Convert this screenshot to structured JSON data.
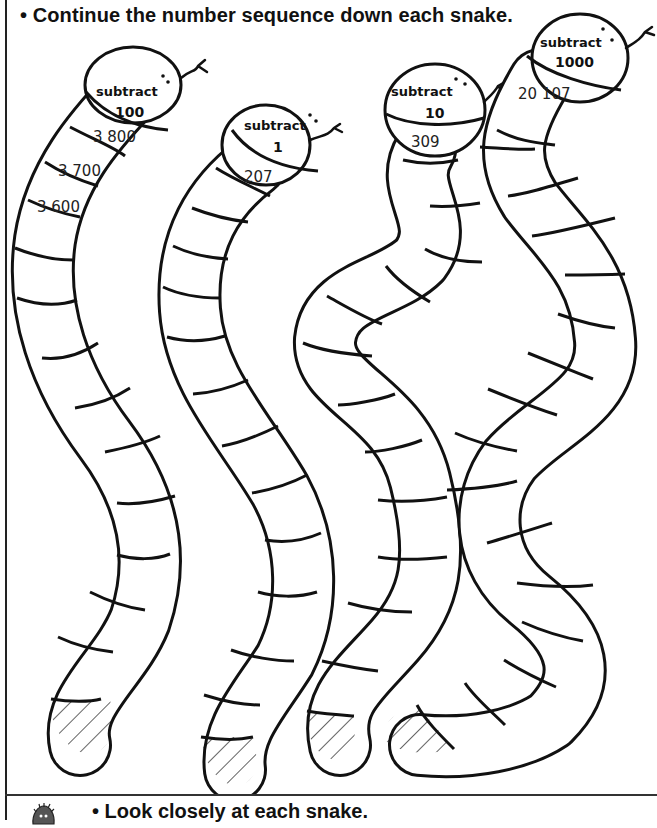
{
  "instructions": {
    "top": "• Continue the number sequence down each snake.",
    "bottom": "• Look closely at each snake."
  },
  "snakes": [
    {
      "operation": "subtract",
      "amount": "100",
      "values": [
        "3 800",
        "3 700",
        "3 600"
      ],
      "empty_segments": 13,
      "tail": "hatched"
    },
    {
      "operation": "subtract",
      "amount": "1",
      "values": [
        "207"
      ],
      "empty_segments": 14,
      "tail": "hatched"
    },
    {
      "operation": "subtract",
      "amount": "10",
      "values": [
        "309"
      ],
      "empty_segments": 15,
      "tail": "hatched"
    },
    {
      "operation": "subtract",
      "amount": "1000",
      "values": [
        "20 107"
      ],
      "empty_segments": 16,
      "tail": "hatched"
    }
  ],
  "icons": {
    "mascot": "hedgehog-icon"
  }
}
